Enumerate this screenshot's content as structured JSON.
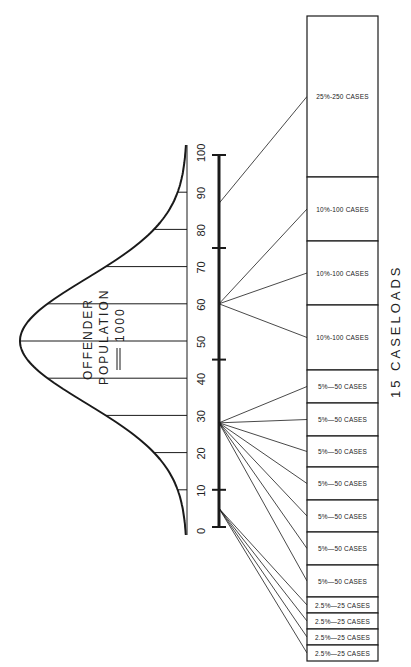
{
  "header": {
    "page_fragment": ""
  },
  "curve": {
    "label_line1": "OFFENDER",
    "label_line2": "POPULATION",
    "label_line3": "1000"
  },
  "scale": {
    "ticks": [
      "0",
      "10",
      "20",
      "30",
      "40",
      "50",
      "60",
      "70",
      "80",
      "90",
      "100"
    ],
    "crossbars": [
      0,
      10,
      45,
      75,
      100
    ]
  },
  "caption": "15  CASELOADS",
  "caseloads": [
    {
      "label": "25%-250 CASES",
      "top": 16,
      "bottom": 177,
      "source": 87
    },
    {
      "label": "10%-100 CASES",
      "top": 177,
      "bottom": 241,
      "source": 60
    },
    {
      "label": "10%-100 CASES",
      "top": 241,
      "bottom": 305,
      "source": 60
    },
    {
      "label": "10%-100 CASES",
      "top": 305,
      "bottom": 370,
      "source": 60
    },
    {
      "label": "5%—50 CASES",
      "top": 370,
      "bottom": 403,
      "source": 28
    },
    {
      "label": "5%—50 CASES",
      "top": 403,
      "bottom": 436,
      "source": 28
    },
    {
      "label": "5%—50 CASES",
      "top": 436,
      "bottom": 467,
      "source": 28
    },
    {
      "label": "5%—50 CASES",
      "top": 467,
      "bottom": 500,
      "source": 28
    },
    {
      "label": "5%—50 CASES",
      "top": 500,
      "bottom": 532,
      "source": 28
    },
    {
      "label": "5%—50 CASES",
      "top": 532,
      "bottom": 565,
      "source": 28
    },
    {
      "label": "5%—50 CASES",
      "top": 565,
      "bottom": 597,
      "source": 28
    },
    {
      "label": "2.5%—25 CASES",
      "top": 597,
      "bottom": 613,
      "source": 5
    },
    {
      "label": "2.5%—25 CASES",
      "top": 613,
      "bottom": 629,
      "source": 5
    },
    {
      "label": "2.5%—25 CASES",
      "top": 629,
      "bottom": 645,
      "source": 5
    },
    {
      "label": "2.5%—25 CASES",
      "top": 645,
      "bottom": 661,
      "source": 5
    }
  ],
  "colors": {
    "ink": "#1a1a1a",
    "paper": "#ffffff"
  }
}
